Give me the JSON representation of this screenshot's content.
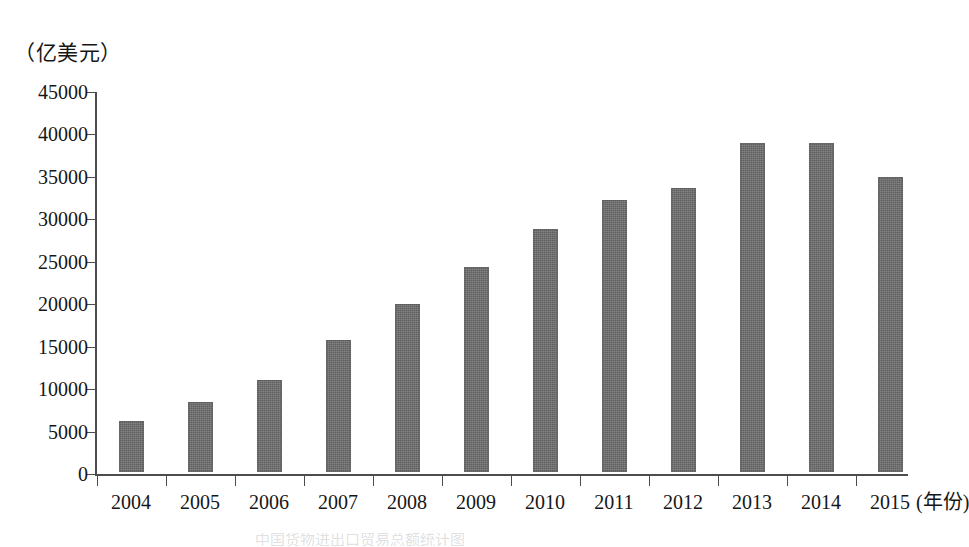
{
  "figure": {
    "unit_label": "（亿美元）",
    "bottom_caption": "中国货物进出口贸易总额统计图"
  },
  "chart_data": {
    "type": "bar",
    "title": "",
    "subtitle": "",
    "xlabel": "(年份)",
    "ylabel": "（亿美元）",
    "categories": [
      "2004",
      "2005",
      "2006",
      "2007",
      "2008",
      "2009",
      "2010",
      "2011",
      "2012",
      "2013",
      "2014",
      "2015"
    ],
    "values": [
      6000,
      8200,
      10800,
      15500,
      19800,
      24200,
      28600,
      32000,
      33400,
      38700,
      38800,
      34800
    ],
    "series": [
      {
        "name": "进出口总额",
        "values": [
          6000,
          8200,
          10800,
          15500,
          19800,
          24200,
          28600,
          32000,
          33400,
          38700,
          38800,
          34800
        ]
      }
    ],
    "ylim": [
      0,
      45000
    ],
    "ytick_step": 5000,
    "ytick_labels": [
      "0",
      "5000",
      "10000",
      "15000",
      "20000",
      "25000",
      "30000",
      "35000",
      "40000",
      "45000"
    ],
    "ytick_values": [
      0,
      5000,
      10000,
      15000,
      20000,
      25000,
      30000,
      35000,
      40000,
      45000
    ],
    "grid": false,
    "legend": "none",
    "bar_color": "#6b6b6b",
    "axis_color": "#4d4d4d"
  }
}
